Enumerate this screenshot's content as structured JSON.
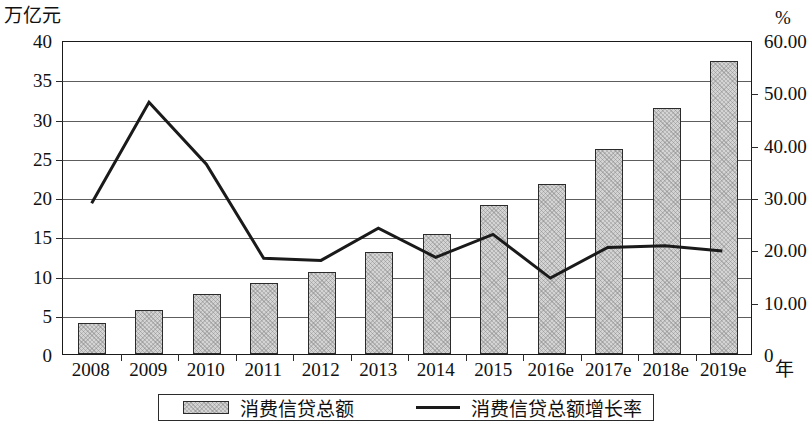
{
  "chart_data": {
    "type": "bar",
    "title": "",
    "subtitle": "",
    "xlabel": "年",
    "ylabel": "万亿元",
    "y2label": "%",
    "categories": [
      "2008",
      "2009",
      "2010",
      "2011",
      "2012",
      "2013",
      "2014",
      "2015",
      "2016e",
      "2017e",
      "2018e",
      "2019e"
    ],
    "ylim": [
      0,
      40
    ],
    "y2lim": [
      0,
      60
    ],
    "yticks": [
      "0",
      "5",
      "10",
      "15",
      "20",
      "25",
      "30",
      "35",
      "40"
    ],
    "y2ticks": [
      "0",
      "10.00",
      "20.00",
      "30.00",
      "40.00",
      "50.00",
      "60.00"
    ],
    "grid": true,
    "legend_position": "bottom",
    "series": [
      {
        "name": "消费信贷总额",
        "type": "bar",
        "axis": "left",
        "unit": "万亿元",
        "color": "#d4d4d4",
        "values": [
          3.9,
          5.6,
          7.6,
          9.0,
          10.5,
          13.0,
          15.3,
          19.0,
          21.7,
          26.1,
          31.3,
          37.3
        ]
      },
      {
        "name": "消费信贷总额增长率",
        "type": "line",
        "axis": "right",
        "unit": "%",
        "color": "#1a1a1a",
        "values": [
          29.0,
          48.4,
          36.5,
          18.4,
          18.0,
          24.2,
          18.6,
          23.0,
          14.6,
          20.5,
          20.8,
          19.8
        ]
      }
    ]
  },
  "axes": {
    "left_unit": "万亿元",
    "right_unit": "%",
    "x_unit": "年"
  },
  "legend": {
    "bar_label": "消费信贷总额",
    "line_label": "消费信贷总额增长率"
  }
}
